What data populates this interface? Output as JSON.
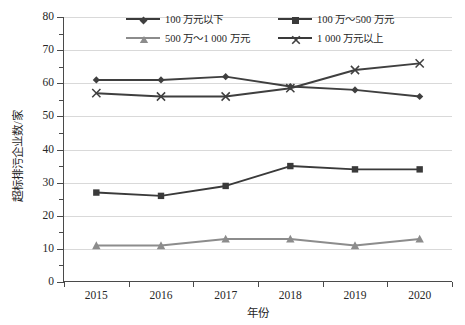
{
  "chart_data": {
    "type": "line",
    "title": "",
    "xlabel": "年份",
    "ylabel": "超标排污企业数/家",
    "categories": [
      "2015",
      "2016",
      "2017",
      "2018",
      "2019",
      "2020"
    ],
    "ylim": [
      0,
      80
    ],
    "ytick_step": 10,
    "yticks": [
      "0",
      "10",
      "20",
      "30",
      "40",
      "50",
      "60",
      "70",
      "80"
    ],
    "minor_ytick_step": 5,
    "grid": "horizontal",
    "legend_position": "top-center",
    "series": [
      {
        "name": "100 万元以下",
        "marker": "diamond",
        "color": "#3f3f3f",
        "values": [
          61,
          61,
          62,
          59,
          58,
          56
        ]
      },
      {
        "name": "100 万～500 万元",
        "marker": "square",
        "color": "#3a3a3a",
        "values": [
          27,
          26,
          29,
          35,
          34,
          34
        ]
      },
      {
        "name": "500 万～1 000 万元",
        "marker": "triangle",
        "color": "#8c8c8c",
        "values": [
          11,
          11,
          13,
          13,
          11,
          13
        ]
      },
      {
        "name": "1 000 万元以上",
        "marker": "cross",
        "color": "#3f3f3f",
        "values": [
          57,
          56,
          56,
          58.5,
          64,
          66
        ]
      }
    ]
  },
  "axis": {
    "y_title": "超标排污企业数/家",
    "x_title": "年份"
  },
  "colors": {
    "grid": "#d9d9d9",
    "axis": "#4a4a4a",
    "dark_series": "#3f3f3f",
    "light_series": "#8c8c8c",
    "text": "#262626",
    "background": "#ffffff"
  }
}
